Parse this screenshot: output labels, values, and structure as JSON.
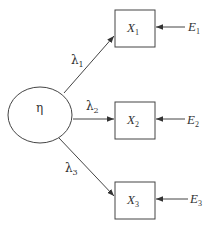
{
  "diagram": {
    "type": "measurement-model",
    "latent": {
      "id": "eta",
      "label": "η",
      "cx": 40,
      "cy": 115,
      "rx": 32,
      "ry": 28
    },
    "indicators": [
      {
        "id": "X1",
        "label": "X",
        "sub": "1",
        "x": 115,
        "y": 10,
        "w": 40,
        "h": 37
      },
      {
        "id": "X2",
        "label": "X",
        "sub": "2",
        "x": 115,
        "y": 102,
        "w": 40,
        "h": 37
      },
      {
        "id": "X3",
        "label": "X",
        "sub": "3",
        "x": 115,
        "y": 182,
        "w": 40,
        "h": 37
      }
    ],
    "errors": [
      {
        "id": "E1",
        "label": "E",
        "sub": "1",
        "target": "X1"
      },
      {
        "id": "E2",
        "label": "E",
        "sub": "2",
        "target": "X2"
      },
      {
        "id": "E3",
        "label": "E",
        "sub": "3",
        "target": "X3"
      }
    ],
    "loadings": [
      {
        "id": "lambda1",
        "label": "λ",
        "sub": "1",
        "from": "eta",
        "to": "X1"
      },
      {
        "id": "lambda2",
        "label": "λ",
        "sub": "2",
        "from": "eta",
        "to": "X2"
      },
      {
        "id": "lambda3",
        "label": "λ",
        "sub": "3",
        "from": "eta",
        "to": "X3"
      }
    ],
    "colors": {
      "stroke": "#444444",
      "background": "#ffffff",
      "text": "#333333"
    }
  }
}
